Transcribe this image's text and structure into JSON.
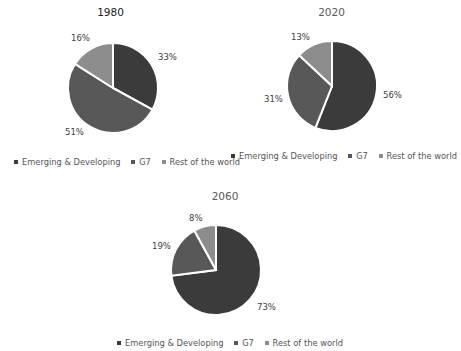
{
  "colors": {
    "emerging": "#3b3b3b",
    "g7": "#585858",
    "rest": "#8c8c8c"
  },
  "legend": {
    "emerging": "Emerging & Developing",
    "g7": "G7",
    "rest": "Rest of the world"
  },
  "charts": [
    {
      "title": "1980",
      "labels": {
        "emerging": "33%",
        "g7": "51%",
        "rest": "16%"
      }
    },
    {
      "title": "2020",
      "labels": {
        "emerging": "56%",
        "g7": "31%",
        "rest": "13%"
      }
    },
    {
      "title": "2060",
      "labels": {
        "emerging": "73%",
        "g7": "19%",
        "rest": "8%"
      }
    }
  ],
  "chart_data": [
    {
      "type": "pie",
      "title": "1980",
      "categories": [
        "Emerging & Developing",
        "G7",
        "Rest of the world"
      ],
      "values": [
        33,
        51,
        16
      ],
      "legend_position": "bottom"
    },
    {
      "type": "pie",
      "title": "2020",
      "categories": [
        "Emerging & Developing",
        "G7",
        "Rest of the world"
      ],
      "values": [
        56,
        31,
        13
      ],
      "legend_position": "bottom"
    },
    {
      "type": "pie",
      "title": "2060",
      "categories": [
        "Emerging & Developing",
        "G7",
        "Rest of the world"
      ],
      "values": [
        73,
        19,
        8
      ],
      "legend_position": "bottom"
    }
  ]
}
